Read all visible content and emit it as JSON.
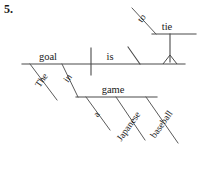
{
  "exercise": {
    "number": "5."
  },
  "diagram": {
    "type": "reed-kellogg-sentence-diagram",
    "sentence": "The goal in a Japanese baseball game is to tie.",
    "line_color": "#4a4a4a",
    "text_color": "#1a1a1a",
    "background": "#ffffff",
    "words": {
      "subject": "goal",
      "subject_article": "The",
      "verb": "is",
      "preposition": "in",
      "object_of_preposition": "game",
      "op_article": "a",
      "op_modifier_1": "Japanese",
      "op_modifier_2": "baseball",
      "infinitive_marker": "to",
      "infinitive_verb": "tie"
    },
    "nodes": [
      {
        "id": "subject",
        "label": "goal",
        "x": 48,
        "y": 58,
        "slot": "baseline-subject"
      },
      {
        "id": "verb",
        "label": "is",
        "x": 110,
        "y": 58,
        "slot": "baseline-verb"
      },
      {
        "id": "article-the",
        "label": "The",
        "x": 44,
        "y": 82,
        "slot": "modifier-slant",
        "rotation": -58
      },
      {
        "id": "prep-in",
        "label": "in",
        "x": 71,
        "y": 80,
        "slot": "modifier-slant",
        "rotation": -58
      },
      {
        "id": "prep-object",
        "label": "game",
        "x": 112,
        "y": 92,
        "slot": "prep-object-line"
      },
      {
        "id": "article-a",
        "label": "a",
        "x": 98,
        "y": 115,
        "slot": "modifier-slant",
        "rotation": -58
      },
      {
        "id": "adj-japanese",
        "label": "Japanese",
        "x": 131,
        "y": 128,
        "slot": "modifier-slant",
        "rotation": -58
      },
      {
        "id": "adj-baseball",
        "label": "baseball",
        "x": 163,
        "y": 126,
        "slot": "modifier-slant",
        "rotation": -58
      },
      {
        "id": "inf-to",
        "label": "to",
        "x": 143,
        "y": 20,
        "slot": "infinitive-slant",
        "rotation": -58
      },
      {
        "id": "inf-tie",
        "label": "tie",
        "x": 166,
        "y": 28,
        "slot": "infinitive-line"
      }
    ]
  }
}
